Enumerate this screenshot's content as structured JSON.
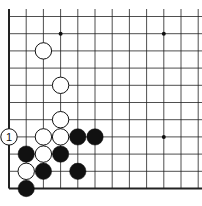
{
  "diagram": {
    "board": {
      "visible_columns": 12,
      "visible_rows": 11,
      "edges": [
        "left",
        "bottom"
      ],
      "line_color": "#222222",
      "background": "#ffffff"
    },
    "star_points": [
      {
        "col": 3,
        "row": 1
      },
      {
        "col": 9,
        "row": 1
      },
      {
        "col": 9,
        "row": 7
      }
    ],
    "stones": [
      {
        "color": "white",
        "col": 2,
        "row": 2
      },
      {
        "color": "white",
        "col": 3,
        "row": 4
      },
      {
        "color": "white",
        "col": 3,
        "row": 6
      },
      {
        "color": "white",
        "col": 0,
        "row": 7,
        "label": "1"
      },
      {
        "color": "white",
        "col": 2,
        "row": 7
      },
      {
        "color": "white",
        "col": 3,
        "row": 7
      },
      {
        "color": "black",
        "col": 4,
        "row": 7
      },
      {
        "color": "black",
        "col": 5,
        "row": 7
      },
      {
        "color": "black",
        "col": 1,
        "row": 8
      },
      {
        "color": "white",
        "col": 2,
        "row": 8
      },
      {
        "color": "black",
        "col": 3,
        "row": 8
      },
      {
        "color": "white",
        "col": 1,
        "row": 9
      },
      {
        "color": "black",
        "col": 2,
        "row": 9
      },
      {
        "color": "black",
        "col": 4,
        "row": 9
      },
      {
        "color": "black",
        "col": 1,
        "row": 10
      }
    ]
  }
}
